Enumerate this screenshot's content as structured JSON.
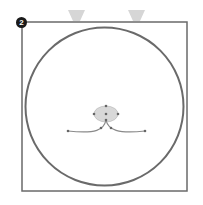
{
  "figure": {
    "step_badge": "2",
    "colors": {
      "frame": "#6a6a6a",
      "circle": "#6a6a6a",
      "nose_fill": "#d8d8d8",
      "mouth": "#8a8a8a",
      "anchor": "#666666",
      "ear_hint": "#d6d6d6",
      "background": "#ffffff"
    },
    "frame": {
      "x": 22,
      "y": 22,
      "width": 165,
      "height": 169
    },
    "circle": {
      "cx": 104.5,
      "cy": 106.5,
      "r": 79
    },
    "nose": {
      "cx": 106,
      "cy": 114,
      "rx": 12,
      "ry": 8
    },
    "mouth": {
      "left_path": "M106 120 C104 130, 96 134, 68 131",
      "right_path": "M106 120 C108 130, 118 134, 145 131"
    },
    "anchor_points": [
      [
        106,
        106
      ],
      [
        94,
        114
      ],
      [
        118,
        114
      ],
      [
        106,
        114
      ],
      [
        106,
        120
      ],
      [
        68,
        131
      ],
      [
        145,
        131
      ],
      [
        101,
        128
      ],
      [
        111,
        128
      ]
    ],
    "ear_hints": [
      {
        "points": "68,10 85,10 80,21 73,21"
      },
      {
        "points": "128,10 145,10 140,21 133,21"
      }
    ]
  }
}
